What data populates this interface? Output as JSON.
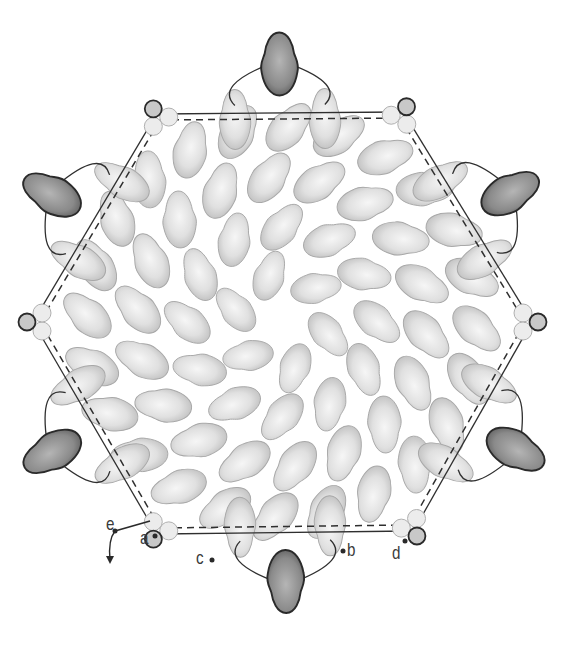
{
  "figure": {
    "colors": {
      "subunit_fill": "#d9d9d9",
      "subunit_edge": "#a8a8a8",
      "peripheral_fill": "#8a8a8a",
      "peripheral_edge": "#2a2a2a",
      "linker_line": "#2f2f2f",
      "small_circle_fill": "#ececec",
      "background": "#ffffff"
    },
    "center": [
      282,
      322
    ],
    "symmetry": 6,
    "labels": [
      {
        "id": "a",
        "text": "a",
        "x": 140,
        "y": 533
      },
      {
        "id": "b",
        "text": "b",
        "x": 347,
        "y": 544
      },
      {
        "id": "c",
        "text": "c",
        "x": 196,
        "y": 551
      },
      {
        "id": "d",
        "text": "d",
        "x": 393,
        "y": 546
      },
      {
        "id": "e",
        "text": "e",
        "x": 107,
        "y": 518
      }
    ],
    "elements": {
      "inner_subunits": "light gray diamond-shaped blobs in spiral rings",
      "peripheral_subunits": 6,
      "vertex_circle_clusters": 6
    }
  }
}
